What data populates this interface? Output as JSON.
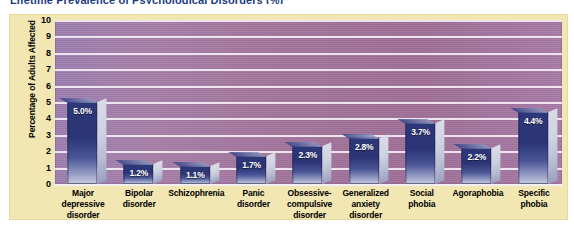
{
  "figure": {
    "title": "Lifetime Prevalence of Psychological Disorders (%)",
    "panel_color": "#f2e7b3",
    "plot_color": "#a3749b",
    "bar_color": "#2e3878",
    "gridline_color": "#f4eef6"
  },
  "chart_data": {
    "type": "bar",
    "title": "Lifetime Prevalence of Psychological Disorders (%)",
    "xlabel": "",
    "ylabel": "Percentage of Adults Affected",
    "ylim": [
      0,
      10
    ],
    "yticks": [
      10,
      9,
      8,
      7,
      6,
      5,
      4,
      3,
      2,
      1,
      0
    ],
    "grid": true,
    "legend": "none",
    "categories": [
      "Major depressive disorder",
      "Bipolar disorder",
      "Schizophrenia",
      "Panic disorder",
      "Obsessive-compulsive disorder",
      "Generalized anxiety disorder",
      "Social phobia",
      "Agoraphobia",
      "Specific phobia"
    ],
    "category_lines": [
      [
        "Major",
        "depressive",
        "disorder"
      ],
      [
        "Bipolar",
        "disorder"
      ],
      [
        "Schizophrenia"
      ],
      [
        "Panic",
        "disorder"
      ],
      [
        "Obsessive-",
        "compulsive",
        "disorder"
      ],
      [
        "Generalized",
        "anxiety",
        "disorder"
      ],
      [
        "Social",
        "phobia"
      ],
      [
        "Agoraphobia"
      ],
      [
        "Specific",
        "phobia"
      ]
    ],
    "values": [
      5.0,
      1.2,
      1.1,
      1.7,
      2.3,
      2.8,
      3.7,
      2.2,
      4.4
    ],
    "data_labels": [
      "5.0%",
      "1.2%",
      "1.1%",
      "1.7%",
      "2.3%",
      "2.8%",
      "3.7%",
      "2.2%",
      "4.4%"
    ]
  }
}
